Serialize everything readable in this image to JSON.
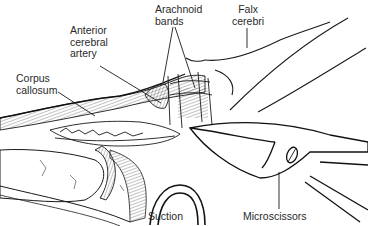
{
  "figure": {
    "type": "anatomical-surgical-illustration",
    "style": "black line art on white",
    "colors": {
      "line": "#1a1a1a",
      "label": "#2a2a2a",
      "background": "#ffffff"
    }
  },
  "labels": {
    "anterior_cerebral_artery": "Anterior\ncerebral\nartery",
    "arachnoid_bands": "Arachnoid\nbands",
    "falx_cerebri": "Falx\ncerebri",
    "corpus_callosum": "Corpus\ncallosum",
    "suction": "Suction",
    "microscissors": "Microscissors"
  }
}
